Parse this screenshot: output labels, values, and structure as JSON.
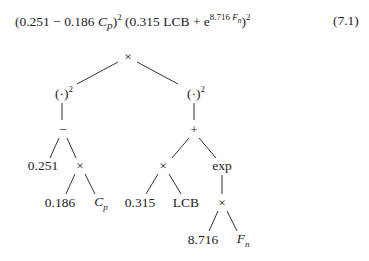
{
  "equation": {
    "part1_open": "(0.251 − 0.186 ",
    "Cp_var": "C",
    "Cp_sub": "p",
    "part1_close": ")",
    "part1_exp": "2",
    "part2_open": " (0.315 LCB + e",
    "exp_coef": "8.716 ",
    "exp_var": "F",
    "exp_sub": "n",
    "part2_close": ")",
    "part2_exp": "2",
    "number": "(7.1)"
  },
  "tree": {
    "root": "×",
    "left_square": "(·)",
    "left_square_exp": "2",
    "right_square": "(·)",
    "right_square_exp": "2",
    "minus": "−",
    "plus": "+",
    "const_0251": "0.251",
    "times_left": "×",
    "times_mid": "×",
    "exp": "exp",
    "const_0186": "0.186",
    "Cp_var": "C",
    "Cp_sub": "p",
    "const_0315": "0.315",
    "LCB": "LCB",
    "times_exp": "×",
    "const_8716": "8.716",
    "Fn_var": "F",
    "Fn_sub": "n"
  },
  "colors": {
    "line": "#333333",
    "text": "#222222",
    "background": "#ffffff"
  }
}
